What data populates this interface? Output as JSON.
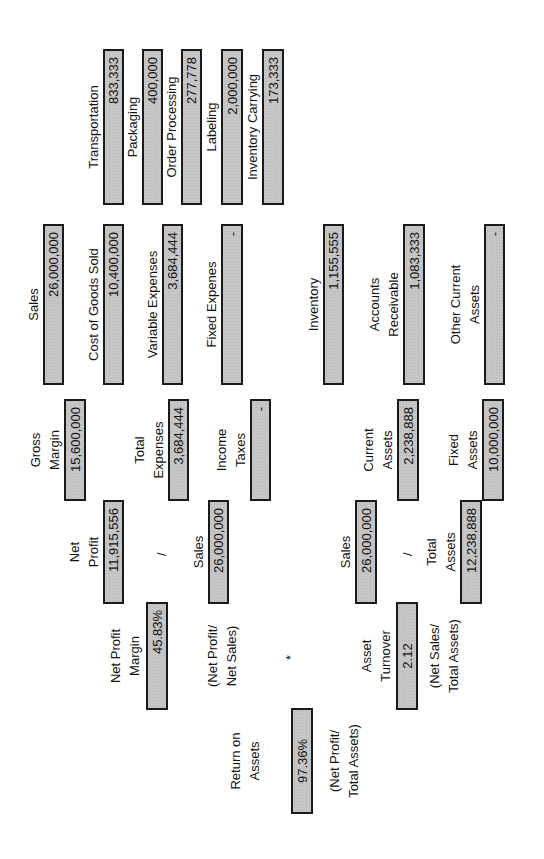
{
  "nodes": {
    "transportation": {
      "label": "Transportation",
      "value": "833,333"
    },
    "packaging": {
      "label": "Packaging",
      "value": "400,000"
    },
    "order_processing": {
      "label": "Order Processing",
      "value": "277,778"
    },
    "labeling": {
      "label": "Labeling",
      "value": "2,000,000"
    },
    "inventory_carrying": {
      "label": "Inventory Carrying",
      "value": "173,333"
    },
    "sales_top": {
      "label": "Sales",
      "value": "26,000,000"
    },
    "cogs": {
      "label": "Cost of Goods Sold",
      "value": "10,400,000"
    },
    "variable_expenses": {
      "label": "Variable Expenses",
      "value": "3,684,444"
    },
    "fixed_expenses": {
      "label": "Fixed Expenes",
      "value": "-"
    },
    "inventory": {
      "label": "Inventory",
      "value": "1,155,555"
    },
    "accounts_receivable": {
      "label_1": "Accounts",
      "label_2": "Receivable",
      "value": "1,083,333"
    },
    "other_current_assets": {
      "label_1": "Other Current",
      "label_2": "Assets",
      "value": "-"
    },
    "gross_margin": {
      "label_1": "Gross",
      "label_2": "Margin",
      "value": "15,600,000"
    },
    "total_expenses": {
      "label_1": "Total",
      "label_2": "Expenses",
      "value": "3,684,444"
    },
    "income_taxes": {
      "label_1": "Income",
      "label_2": "Taxes",
      "value": "-"
    },
    "current_assets": {
      "label_1": "Current",
      "label_2": "Assets",
      "value": "2,238,888"
    },
    "fixed_assets": {
      "label_1": "Fixed",
      "label_2": "Assets",
      "value": "10,000,000"
    },
    "net_profit": {
      "label_1": "Net",
      "label_2": "Profit",
      "value": "11,915,556"
    },
    "sales_mid": {
      "label": "Sales",
      "value": "26,000,000"
    },
    "sales_bottom": {
      "label": "Sales",
      "value": "26,000,000"
    },
    "total_assets": {
      "label_1": "Total",
      "label_2": "Assets",
      "value": "12,238,888"
    },
    "net_profit_margin": {
      "label_1": "Net Profit",
      "label_2": "Margin",
      "value": "45.83%",
      "formula_1": "(Net Profit/",
      "formula_2": "Net Sales)"
    },
    "asset_turnover": {
      "label_1": "Asset",
      "label_2": "Turnover",
      "value": "2.12",
      "formula_1": "(Net Sales/",
      "formula_2": "Total Assets)"
    },
    "return_on_assets": {
      "label_1": "Return on",
      "label_2": "Assets",
      "value": "97.36%",
      "formula_1": "(Net Profit/",
      "formula_2": "Total Assets)"
    }
  },
  "operators": {
    "divide_profit": "/",
    "divide_assets": "/",
    "multiply": "*"
  }
}
